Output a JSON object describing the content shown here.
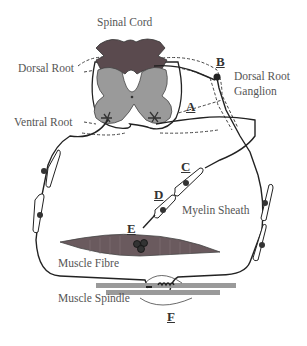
{
  "diagram": {
    "type": "reflex-arc-anatomy",
    "labels": {
      "spinal_cord": "Spinal Cord",
      "dorsal_root": "Dorsal Root",
      "ventral_root": "Ventral Root",
      "dorsal_root_ganglion_line1": "Dorsal Root",
      "dorsal_root_ganglion_line2": "Ganglion",
      "myelin_sheath": "Myelin Sheath",
      "muscle_fibre": "Muscle Fibre",
      "muscle_spindle": "Muscle Spindle"
    },
    "letters": {
      "a": "A",
      "b": "B",
      "c": "C",
      "d": "D",
      "e": "E",
      "f": "F"
    },
    "colors": {
      "white_matter_dark": "#5a4a4e",
      "grey_matter": "#9a9a9a",
      "nerve_line": "#222222",
      "muscle_fibre": "#6a5a5e",
      "spindle_bar": "#9a9a9a",
      "label_text": "#555555"
    }
  }
}
